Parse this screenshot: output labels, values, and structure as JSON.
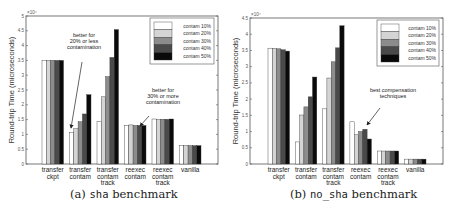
{
  "chart_data": [
    {
      "type": "bar",
      "title": "",
      "caption_prefix": "(a)",
      "caption_code": "sha",
      "caption_suffix": "benchmark",
      "xlabel": "",
      "ylabel": "Round-trip Time (microseconds)",
      "y_multiplier": "×10⁴",
      "ylim": [
        0,
        5
      ],
      "yticks": [
        "0",
        "0.5",
        "1",
        "1.5",
        "2",
        "2.5",
        "3",
        "3.5",
        "4",
        "4.5",
        "5"
      ],
      "grid": false,
      "legend_position": "upper right",
      "categories": [
        [
          "transfer",
          "ckpt"
        ],
        [
          "transfer",
          "contam"
        ],
        [
          "transfer",
          "contam",
          "track"
        ],
        [
          "reexec",
          "contam"
        ],
        [
          "reexec",
          "contam",
          "track"
        ],
        [
          "vanilla"
        ]
      ],
      "series": [
        {
          "name": "contam 10%",
          "color": "#ffffff",
          "values": [
            3.5,
            1.06,
            1.43,
            1.3,
            1.52,
            0.62
          ]
        },
        {
          "name": "contam 20%",
          "color": "#d4d4d4",
          "values": [
            3.5,
            1.19,
            2.27,
            1.32,
            1.5,
            0.62
          ]
        },
        {
          "name": "contam 30%",
          "color": "#8c8c8c",
          "values": [
            3.5,
            1.43,
            2.95,
            1.3,
            1.51,
            0.62
          ]
        },
        {
          "name": "contam 40%",
          "color": "#4a4a4a",
          "values": [
            3.5,
            1.69,
            3.6,
            1.3,
            1.51,
            0.62
          ]
        },
        {
          "name": "contam 50%",
          "color": "#0a0a0a",
          "values": [
            3.5,
            2.34,
            4.54,
            1.3,
            1.52,
            0.62
          ]
        }
      ],
      "annotations": [
        {
          "text": [
            "better for",
            "20% or less",
            "contamination"
          ],
          "target": "transfer contam"
        },
        {
          "text": [
            "better for",
            "30% or more",
            "contamination"
          ],
          "target": "reexec contam"
        }
      ]
    },
    {
      "type": "bar",
      "title": "",
      "caption_prefix": "(b)",
      "caption_code": "no_sha",
      "caption_suffix": "benchmark",
      "xlabel": "",
      "ylabel": "Round-trip Time (microseconds)",
      "y_multiplier": "×10⁴",
      "ylim": [
        0,
        4.5
      ],
      "yticks": [
        "0",
        "0.5",
        "1",
        "1.5",
        "2",
        "2.5",
        "3",
        "3.5",
        "4",
        "4.5"
      ],
      "grid": false,
      "legend_position": "upper right",
      "categories": [
        [
          "transfer",
          "ckpt"
        ],
        [
          "transfer",
          "contam"
        ],
        [
          "transfer",
          "contam",
          "track"
        ],
        [
          "reexec",
          "contam"
        ],
        [
          "reexec",
          "contam",
          "track"
        ],
        [
          "vanilla"
        ]
      ],
      "series": [
        {
          "name": "contam 10%",
          "color": "#ffffff",
          "values": [
            3.57,
            0.68,
            1.7,
            1.3,
            0.4,
            0.15
          ]
        },
        {
          "name": "contam 20%",
          "color": "#d4d4d4",
          "values": [
            3.56,
            1.51,
            2.65,
            0.9,
            0.4,
            0.15
          ]
        },
        {
          "name": "contam 30%",
          "color": "#8c8c8c",
          "values": [
            3.55,
            1.76,
            3.15,
            1.0,
            0.4,
            0.15
          ]
        },
        {
          "name": "contam 40%",
          "color": "#4a4a4a",
          "values": [
            3.52,
            2.07,
            3.58,
            1.07,
            0.4,
            0.15
          ]
        },
        {
          "name": "contam 50%",
          "color": "#0a0a0a",
          "values": [
            3.48,
            2.68,
            4.26,
            0.77,
            0.4,
            0.15
          ]
        }
      ],
      "annotations": [
        {
          "text": [
            "best compensation",
            "techniques"
          ],
          "target": "reexec contam, reexec contam track"
        }
      ]
    }
  ]
}
